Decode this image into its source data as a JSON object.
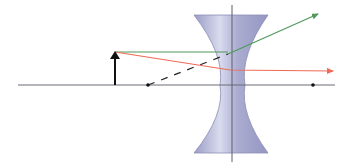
{
  "diagram": {
    "type": "diverging-lens-ray-diagram",
    "colors": {
      "background": "#ffffff",
      "lens_fill": "#a9abcf",
      "lens_stroke": "#8a8db5",
      "axis": "#6b6b78",
      "object": "#111111",
      "ray_parallel": "#4f9a5c",
      "ray_central": "#ef6a55",
      "virtual_ray": "#222222",
      "focal_point": "#111111"
    },
    "optical_axis": {
      "x1": 18,
      "y1": 85,
      "x2": 335,
      "y2": 85
    },
    "lens_axis": {
      "x1": 232,
      "y1": 5,
      "x2": 232,
      "y2": 162
    },
    "lens": {
      "top_y": 15,
      "bottom_y": 153,
      "left_x": 194,
      "right_x": 268,
      "waist_left_x": 220,
      "waist_right_x": 245
    },
    "object_arrow": {
      "x": 115,
      "base_y": 85,
      "tip_y": 52
    },
    "focal_points": [
      {
        "x": 148,
        "y": 85
      },
      {
        "x": 313,
        "y": 85
      }
    ],
    "rays": [
      {
        "name": "parallel-ray",
        "points": [
          [
            115,
            52
          ],
          [
            228,
            52
          ],
          [
            318,
            14
          ]
        ]
      },
      {
        "name": "central-ray",
        "points": [
          [
            115,
            52
          ],
          [
            230,
            70
          ],
          [
            333,
            71
          ]
        ]
      }
    ],
    "virtual_extension": {
      "x1": 148,
      "y1": 85,
      "x2": 228,
      "y2": 54
    }
  }
}
